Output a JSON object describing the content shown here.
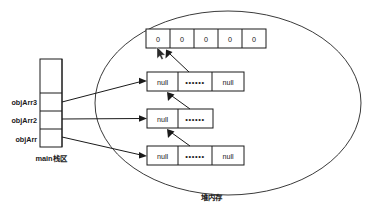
{
  "diagram": {
    "stack_region": {
      "label": "main栈区",
      "name": "main-stack-region",
      "slots": [
        {
          "label": "objArr3",
          "name": "stack-slot-objarr3"
        },
        {
          "label": "objArr2",
          "name": "stack-slot-objarr2"
        },
        {
          "label": "objArr",
          "name": "stack-slot-objarr"
        }
      ]
    },
    "heap_region": {
      "label": "堆内存",
      "name": "heap-region"
    },
    "array_object": {
      "name": "int-array-object",
      "cells": [
        "0",
        "0",
        "0",
        "0",
        "0"
      ]
    },
    "objects": [
      {
        "name": "heap-object-top",
        "cells": [
          "null",
          "••••••",
          "null"
        ]
      },
      {
        "name": "heap-object-middle",
        "cells": [
          "null",
          "••••••"
        ]
      },
      {
        "name": "heap-object-bottom",
        "cells": [
          "null",
          "••••••",
          "null"
        ]
      }
    ],
    "colors": {
      "stroke": "#1a1a1a",
      "ellipse": "#3a3a3a",
      "background": "#ffffff"
    }
  }
}
